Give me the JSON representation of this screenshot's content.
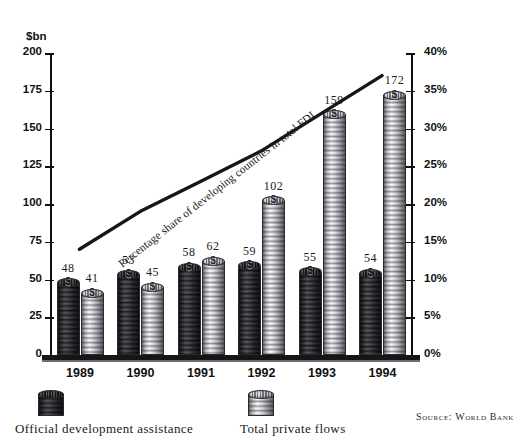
{
  "chart_data": {
    "type": "bar",
    "title": "",
    "subtitle": "",
    "ylabel": "$bn",
    "xlabel": "",
    "categories": [
      "1989",
      "1990",
      "1991",
      "1992",
      "1993",
      "1994"
    ],
    "series": [
      {
        "name": "Official development assistance",
        "values": [
          48,
          41,
          53,
          45,
          58,
          62
        ]
      },
      {
        "name": "Total private flows",
        "values": [
          59,
          102,
          55,
          159,
          54,
          172
        ]
      }
    ],
    "bars": [
      {
        "year": "1989",
        "oda": 48,
        "private": 41
      },
      {
        "year": "1990",
        "oda": 53,
        "private": 45
      },
      {
        "year": "1991",
        "oda": 58,
        "private": 62
      },
      {
        "year": "1992",
        "oda": 59,
        "private": 102
      },
      {
        "year": "1993",
        "oda": 55,
        "private": 159
      },
      {
        "year": "1994",
        "oda": 54,
        "private": 172
      }
    ],
    "line": {
      "name": "Percentage share of developing countries in total FDI",
      "values": [
        14,
        19,
        23,
        27,
        32,
        37
      ],
      "axis": "right"
    },
    "yaxis_left": {
      "label": "$bn",
      "ticks": [
        "0",
        "25",
        "50",
        "75",
        "100",
        "125",
        "150",
        "175",
        "200"
      ],
      "min": 0,
      "max": 200
    },
    "yaxis_right": {
      "ticks": [
        "0%",
        "5%",
        "10%",
        "15%",
        "20%",
        "25%",
        "30%",
        "35%",
        "40%"
      ],
      "min": 0,
      "max": 40
    },
    "grid": false,
    "legend_position": "bottom"
  },
  "axis": {
    "unit_label": "$bn",
    "left_ticks": [
      {
        "label": "200",
        "value": 200
      },
      {
        "label": "175",
        "value": 175
      },
      {
        "label": "150",
        "value": 150
      },
      {
        "label": "125",
        "value": 125
      },
      {
        "label": "100",
        "value": 100
      },
      {
        "label": "75",
        "value": 75
      },
      {
        "label": "50",
        "value": 50
      },
      {
        "label": "25",
        "value": 25
      },
      {
        "label": "0",
        "value": 0
      }
    ],
    "right_ticks": [
      {
        "label": "40%",
        "value": 40
      },
      {
        "label": "35%",
        "value": 35
      },
      {
        "label": "30%",
        "value": 30
      },
      {
        "label": "25%",
        "value": 25
      },
      {
        "label": "20%",
        "value": 20
      },
      {
        "label": "15%",
        "value": 15
      },
      {
        "label": "10%",
        "value": 10
      },
      {
        "label": "5%",
        "value": 5
      },
      {
        "label": "0%",
        "value": 0
      }
    ]
  },
  "groups": [
    {
      "year": "1989",
      "oda": {
        "label": "48",
        "value": 48
      },
      "private": {
        "label": "41",
        "value": 41
      }
    },
    {
      "year": "1990",
      "oda": {
        "label": "53",
        "value": 53
      },
      "private": {
        "label": "45",
        "value": 45
      }
    },
    {
      "year": "1991",
      "oda": {
        "label": "58",
        "value": 58
      },
      "private": {
        "label": "62",
        "value": 62
      }
    },
    {
      "year": "1992",
      "oda": {
        "label": "59",
        "value": 59
      },
      "private": {
        "label": "102",
        "value": 102
      }
    },
    {
      "year": "1993",
      "oda": {
        "label": "55",
        "value": 55
      },
      "private": {
        "label": "159",
        "value": 159
      }
    },
    {
      "year": "1994",
      "oda": {
        "label": "54",
        "value": 54
      },
      "private": {
        "label": "172",
        "value": 172
      }
    }
  ],
  "trend": {
    "label": "Percentage share of developing countries in total FDI"
  },
  "legend": {
    "oda_label": "Official development assistance",
    "private_label": "Total private flows"
  },
  "source": "Source: World Bank",
  "colors": {
    "ink": "#1a1a1a",
    "axis": "#111111",
    "oda_fill": "#5a5a60",
    "private_fill": "#d8d8dd",
    "baseline": "#15151a"
  }
}
